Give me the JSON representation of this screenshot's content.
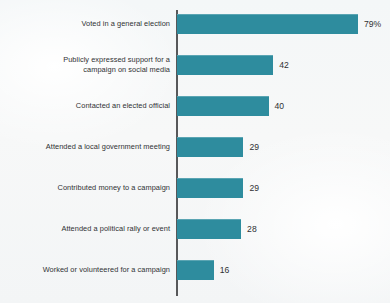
{
  "chart_data": {
    "type": "bar",
    "orientation": "horizontal",
    "title": "",
    "subtitle": "",
    "xlabel": "",
    "ylabel": "",
    "xlim": [
      0,
      100
    ],
    "grid": false,
    "legend": null,
    "accent_color": "#2e8c9e",
    "axis_color": "#57585a",
    "background_color": "#f6f8f8",
    "text_color": "#2f3133",
    "categories": [
      "Voted in a general election",
      "Publicly expressed support for a\ncampaign on social media",
      "Contacted an elected official",
      "Attended a local government meeting",
      "Contributed money to a campaign",
      "Attended a political rally or event",
      "Worked or volunteered for a campaign"
    ],
    "values": [
      79,
      42,
      40,
      29,
      29,
      28,
      16
    ],
    "value_labels": [
      "79%",
      "42",
      "40",
      "29",
      "29",
      "28",
      "16"
    ],
    "units": "percent"
  },
  "bars": [
    {
      "label": "Voted in a general election",
      "value": 79,
      "value_label": "79%"
    },
    {
      "label": "Publicly expressed support for a\ncampaign on social media",
      "value": 42,
      "value_label": "42"
    },
    {
      "label": "Contacted an elected official",
      "value": 40,
      "value_label": "40"
    },
    {
      "label": "Attended a local government meeting",
      "value": 29,
      "value_label": "29"
    },
    {
      "label": "Contributed money to a campaign",
      "value": 29,
      "value_label": "29"
    },
    {
      "label": "Attended a political rally or event",
      "value": 28,
      "value_label": "28"
    },
    {
      "label": "Worked or volunteered for a campaign",
      "value": 16,
      "value_label": "16"
    }
  ]
}
